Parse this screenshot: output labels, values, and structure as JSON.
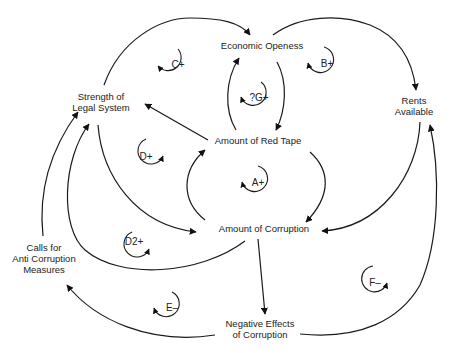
{
  "diagram": {
    "type": "causal-loop-diagram",
    "nodes": {
      "economic_openness": {
        "label": "Economic Openess"
      },
      "strength_legal": {
        "line1": "Strength of",
        "line2": "Legal System"
      },
      "rents_available": {
        "line1": "Rents",
        "line2": "Available"
      },
      "red_tape": {
        "label": "Amount of Red Tape"
      },
      "corruption": {
        "label": "Amount of Corruption"
      },
      "calls_anti": {
        "line1": "Calls for",
        "line2": "Anti Corruption",
        "line3": "Measures"
      },
      "negative_effects": {
        "line1": "Negative Effects",
        "line2": "of Corruption"
      }
    },
    "loops": {
      "A": "A+",
      "B": "B+",
      "C": "C+",
      "D": "D+",
      "D2": "D2+",
      "E": "E–",
      "F": "F–",
      "G": "?G+"
    },
    "edges": [
      {
        "from": "Strength of Legal System",
        "to": "Economic Openess"
      },
      {
        "from": "Economic Openess",
        "to": "Rents Available"
      },
      {
        "from": "Amount of Red Tape",
        "to": "Economic Openess"
      },
      {
        "from": "Economic Openess",
        "to": "Amount of Red Tape"
      },
      {
        "from": "Amount of Red Tape",
        "to": "Strength of Legal System"
      },
      {
        "from": "Amount of Red Tape",
        "to": "Amount of Corruption"
      },
      {
        "from": "Amount of Corruption",
        "to": "Amount of Red Tape"
      },
      {
        "from": "Rents Available",
        "to": "Amount of Corruption"
      },
      {
        "from": "Strength of Legal System",
        "to": "Amount of Corruption"
      },
      {
        "from": "Amount of Corruption",
        "to": "Strength of Legal System"
      },
      {
        "from": "Calls for Anti Corruption Measures",
        "to": "Strength of Legal System"
      },
      {
        "from": "Amount of Corruption",
        "to": "Negative Effects of Corruption"
      },
      {
        "from": "Negative Effects of Corruption",
        "to": "Calls for Anti Corruption Measures"
      },
      {
        "from": "Negative Effects of Corruption",
        "to": "Rents Available"
      }
    ]
  }
}
